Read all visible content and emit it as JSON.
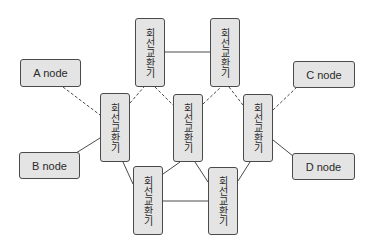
{
  "diagram": {
    "type": "network-topology",
    "colors": {
      "box_fill": "#e4e4e4",
      "box_border": "#4a4a4a",
      "line": "#4a4a4a",
      "text": "#2a2a2a"
    },
    "end_nodes": [
      {
        "id": "A",
        "label": "A node"
      },
      {
        "id": "B",
        "label": "B node"
      },
      {
        "id": "C",
        "label": "C node"
      },
      {
        "id": "D",
        "label": "D node"
      }
    ],
    "switches": [
      {
        "id": "S1",
        "label": "회선교환기",
        "position": "top-left"
      },
      {
        "id": "S2",
        "label": "회선교환기",
        "position": "top-right"
      },
      {
        "id": "S3",
        "label": "회선교환기",
        "position": "middle-left"
      },
      {
        "id": "S4",
        "label": "회선교환기",
        "position": "middle-center"
      },
      {
        "id": "S5",
        "label": "회선교환기",
        "position": "middle-right"
      },
      {
        "id": "S6",
        "label": "회선교환기",
        "position": "bottom-left"
      },
      {
        "id": "S7",
        "label": "회선교환기",
        "position": "bottom-right"
      }
    ],
    "edges": [
      {
        "from": "A",
        "to": "S3",
        "style": "dashed"
      },
      {
        "from": "S3",
        "to": "S1",
        "style": "dashed"
      },
      {
        "from": "S1",
        "to": "S4",
        "style": "dashed"
      },
      {
        "from": "S4",
        "to": "S2",
        "style": "dashed"
      },
      {
        "from": "S2",
        "to": "S5",
        "style": "dashed"
      },
      {
        "from": "S5",
        "to": "C",
        "style": "dashed"
      },
      {
        "from": "S1",
        "to": "S2",
        "style": "solid"
      },
      {
        "from": "B",
        "to": "S3",
        "style": "solid"
      },
      {
        "from": "S3",
        "to": "S6",
        "style": "solid"
      },
      {
        "from": "S4",
        "to": "S6",
        "style": "solid"
      },
      {
        "from": "S4",
        "to": "S7",
        "style": "solid"
      },
      {
        "from": "S5",
        "to": "S7",
        "style": "solid"
      },
      {
        "from": "S6",
        "to": "S7",
        "style": "solid"
      },
      {
        "from": "S5",
        "to": "D",
        "style": "solid"
      }
    ]
  }
}
